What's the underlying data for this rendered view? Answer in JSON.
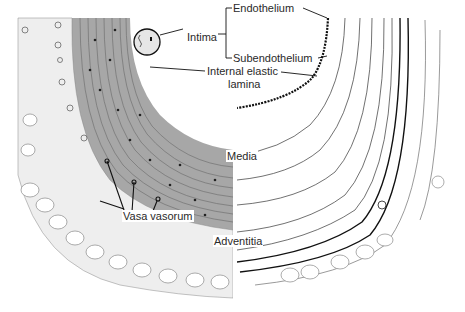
{
  "figure": {
    "left_half": "tissue stained to show nuclei and muscle layers",
    "right_half": "tissue stained to show elastic fibers"
  },
  "labels": {
    "intima": "Intima",
    "endothelium": "Endothelium",
    "subendothelium": "Subendothelium",
    "internal_elastic_line1": "Internal elastic",
    "internal_elastic_line2": "lamina",
    "media": "Media",
    "vasa_vasorum": "Vasa vasorum",
    "adventitia": "Adventitia"
  },
  "colors": {
    "ink": "#1a1a1a",
    "media_shade": "#8a8a8a",
    "light_stroke": "#9a9a9a",
    "background": "#ffffff"
  }
}
